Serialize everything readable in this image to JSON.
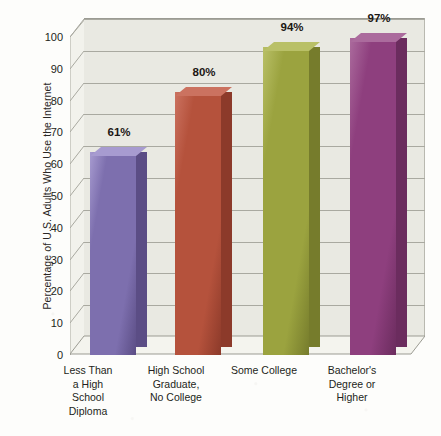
{
  "chart_data": {
    "type": "bar",
    "title": "",
    "xlabel": "",
    "ylabel": "Percentage of U.S. Adults Who Use the Internet",
    "ylim": [
      0,
      100
    ],
    "ytick_labels": [
      "0",
      "10",
      "20",
      "30",
      "40",
      "50",
      "60",
      "70",
      "80",
      "90",
      "100"
    ],
    "ytick_values": [
      0,
      10,
      20,
      30,
      40,
      50,
      60,
      70,
      80,
      90,
      100
    ],
    "grid": true,
    "legend": "none",
    "categories": [
      "Less Than\na High\nSchool\nDiploma",
      "High School\nGraduate,\nNo College",
      "Some College",
      "Bachelor's\nDegree or\nHigher"
    ],
    "values": [
      61,
      80,
      94,
      97
    ],
    "data_labels": [
      "61%",
      "80%",
      "94%",
      "97%"
    ],
    "bar_colors": [
      "#7d6fae",
      "#b5523c",
      "#9ba33f",
      "#8e3f7e"
    ],
    "bar_colors_side": [
      "#5b4d85",
      "#8c3a2a",
      "#767c2c",
      "#6b2c5e"
    ],
    "bar_colors_top": [
      "#a79bd0",
      "#cb7260",
      "#b9c067",
      "#ab6b9d"
    ]
  },
  "axis": {
    "ticks": [
      {
        "label": "100",
        "value": 100
      },
      {
        "label": "90",
        "value": 90
      },
      {
        "label": "80",
        "value": 80
      },
      {
        "label": "70",
        "value": 70
      },
      {
        "label": "60",
        "value": 60
      },
      {
        "label": "50",
        "value": 50
      },
      {
        "label": "40",
        "value": 40
      },
      {
        "label": "30",
        "value": 30
      },
      {
        "label": "20",
        "value": 20
      },
      {
        "label": "10",
        "value": 10
      },
      {
        "label": "0",
        "value": 0
      }
    ]
  },
  "bars": [
    {
      "label": "61%",
      "category_lines": [
        "Less Than",
        "a High",
        "School",
        "Diploma"
      ]
    },
    {
      "label": "80%",
      "category_lines": [
        "High School",
        "Graduate,",
        "No College"
      ]
    },
    {
      "label": "94%",
      "category_lines": [
        "Some College"
      ]
    },
    {
      "label": "97%",
      "category_lines": [
        "Bachelor's",
        "Degree or",
        "Higher"
      ]
    }
  ]
}
